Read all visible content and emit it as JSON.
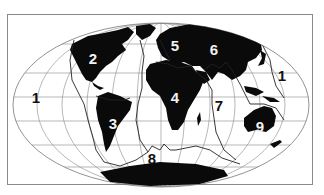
{
  "map": {
    "title": "",
    "type": "world-tectonic-plates",
    "projection": "mollweide-like",
    "colors": {
      "land": "#0a0a0a",
      "ocean": "#ffffff",
      "grid": "#777777",
      "boundary": "#222222",
      "frame": "#8a8a8a"
    },
    "labels": [
      {
        "id": "1-west",
        "text": "1",
        "x": 36,
        "y": 97,
        "tone": "dark"
      },
      {
        "id": "2",
        "text": "2",
        "x": 93,
        "y": 58,
        "tone": "light"
      },
      {
        "id": "3",
        "text": "3",
        "x": 113,
        "y": 123,
        "tone": "light"
      },
      {
        "id": "4",
        "text": "4",
        "x": 175,
        "y": 97,
        "tone": "light"
      },
      {
        "id": "5",
        "text": "5",
        "x": 175,
        "y": 45,
        "tone": "light"
      },
      {
        "id": "6",
        "text": "6",
        "x": 214,
        "y": 49,
        "tone": "light"
      },
      {
        "id": "7",
        "text": "7",
        "x": 219,
        "y": 105,
        "tone": "dark"
      },
      {
        "id": "1-east",
        "text": "1",
        "x": 282,
        "y": 75,
        "tone": "dark"
      },
      {
        "id": "8",
        "text": "8",
        "x": 152,
        "y": 158,
        "tone": "dark"
      },
      {
        "id": "9",
        "text": "9",
        "x": 260,
        "y": 126,
        "tone": "light"
      }
    ]
  }
}
